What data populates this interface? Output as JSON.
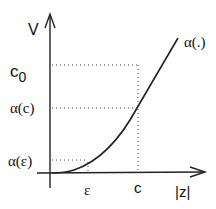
{
  "diagram": {
    "y_axis_label": "V",
    "x_axis_label": "|z|",
    "curve_label": "α(.)",
    "y_ticks": [
      {
        "label_main": "c",
        "label_sub": "0",
        "key": "c0"
      },
      {
        "label": "α(c)",
        "key": "alpha_c"
      },
      {
        "label": "α(ε)",
        "key": "alpha_eps"
      }
    ],
    "x_ticks": [
      {
        "label": "ε",
        "key": "eps"
      },
      {
        "label": "c",
        "key": "c"
      }
    ],
    "colors": {
      "line": "#222222",
      "dotted": "#444444",
      "text": "#111111"
    }
  }
}
